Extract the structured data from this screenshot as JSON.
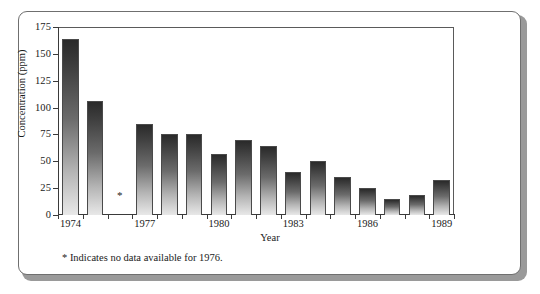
{
  "chart_data": {
    "type": "bar",
    "title": "",
    "xlabel": "Year",
    "ylabel": "Concentration (ppm)",
    "ylim": [
      0,
      175
    ],
    "yticks": [
      0,
      25,
      50,
      75,
      100,
      125,
      150,
      175
    ],
    "ytick_labels": [
      "0",
      "25",
      "50",
      "75",
      "100",
      "125",
      "150",
      "175"
    ],
    "grid": false,
    "legend": null,
    "categories": [
      "1974",
      "1975",
      "1976",
      "1977",
      "1978",
      "1979",
      "1980",
      "1981",
      "1982",
      "1983",
      "1984",
      "1985",
      "1986",
      "1987",
      "1988",
      "1989"
    ],
    "xtick_labels": [
      "1974",
      "1977",
      "1980",
      "1983",
      "1986",
      "1989"
    ],
    "values": [
      164,
      106,
      null,
      85,
      75,
      75,
      57,
      70,
      64,
      40,
      50,
      35,
      25,
      15,
      19,
      33
    ],
    "annotations": [
      {
        "category": "1976",
        "marker": "*",
        "note": "no data available"
      }
    ],
    "footnote": "* Indicates no data available for 1976."
  },
  "style": {
    "bar_top_color": "#2a2a2a",
    "bar_bottom_color": "#e8e8e8",
    "bar_border_color": "#4a4a4a",
    "axis_color": "#3a3a3a",
    "text_color": "#1a1a1a",
    "frame_border_color": "#6f6f6f",
    "background": "#ffffff"
  }
}
